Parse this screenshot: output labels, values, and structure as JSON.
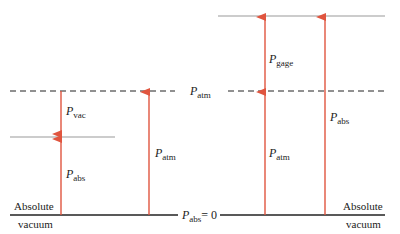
{
  "diagram": {
    "title": "",
    "colors": {
      "arrow": "#e0553f",
      "line": "#222222",
      "gray_line": "#999999"
    },
    "labels": {
      "p_vac": {
        "symbol": "P",
        "sub": "vac"
      },
      "p_abs_left": {
        "symbol": "P",
        "sub": "abs"
      },
      "p_atm_left": {
        "symbol": "P",
        "sub": "atm"
      },
      "p_atm_center": {
        "symbol": "P",
        "sub": "atm"
      },
      "p_gage": {
        "symbol": "P",
        "sub": "gage"
      },
      "p_atm_right": {
        "symbol": "P",
        "sub": "atm"
      },
      "p_abs_right": {
        "symbol": "P",
        "sub": "abs"
      },
      "p_abs_zero": {
        "symbol": "P",
        "sub": "abs",
        "eq": "= 0"
      }
    },
    "left_caption": {
      "line1": "Absolute",
      "line2": "vacuum"
    },
    "right_caption": {
      "line1": "Absolute",
      "line2": "vacuum"
    }
  }
}
